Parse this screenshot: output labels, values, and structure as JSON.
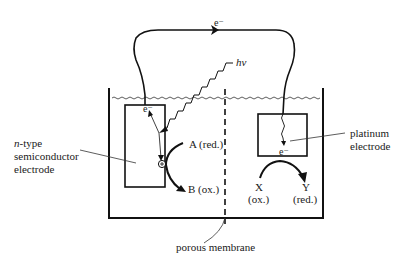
{
  "diagram": {
    "labels": {
      "electron_wire": "e⁻",
      "photon": "hν",
      "semiconductor_electron": "e⁻",
      "hole": "⊕",
      "semiconductor_label_line1_italic": "n",
      "semiconductor_label_line1_rest": "-type",
      "semiconductor_label_line2": "semiconductor",
      "semiconductor_label_line3": "electrode",
      "species_A": "A (red.)",
      "species_B": "B (ox.)",
      "platinum_label_line1": "platinum",
      "platinum_label_line2": "electrode",
      "platinum_electron": "e⁻",
      "species_X": "X",
      "species_X_state": "(ox.)",
      "species_Y": "Y",
      "species_Y_state": "(red.)",
      "membrane_label": "porous membrane"
    },
    "colors": {
      "line": "#111111",
      "background": "#ffffff"
    }
  }
}
